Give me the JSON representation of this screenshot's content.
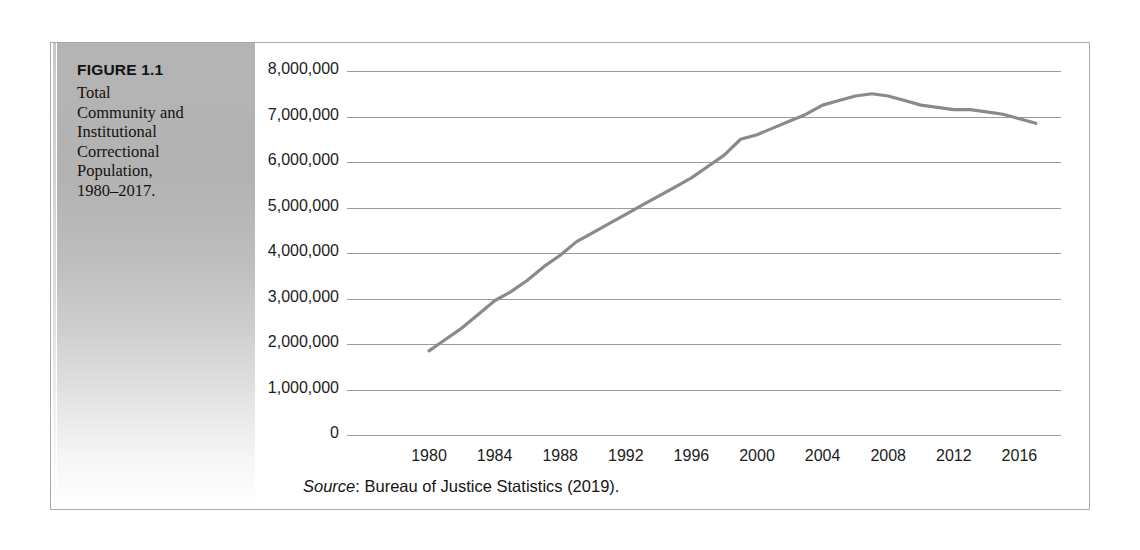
{
  "figure": {
    "label": "FIGURE 1.1",
    "caption": "Total Community and Institutional Correctional Population, 1980–2017.",
    "source_word": "Source",
    "source_separator": ": ",
    "source_text": "Bureau of Justice Statistics (2019)."
  },
  "colors": {
    "frame_border": "#a9a9a9",
    "gridline": "#9b9b9b",
    "series_line": "#8a8a8a",
    "panel_top": "#b4b4b4",
    "panel_bottom": "#ffffff",
    "text": "#1c1c1c"
  },
  "chart_data": {
    "type": "line",
    "title": "Total Community and Institutional Correctional Population, 1980–2017.",
    "xlabel": "",
    "ylabel": "",
    "xlim": [
      1980,
      2017
    ],
    "ylim": [
      0,
      8000000
    ],
    "grid": true,
    "legend": "none",
    "y_tick_labels": [
      "8,000,000",
      "7,000,000",
      "6,000,000",
      "5,000,000",
      "4,000,000",
      "3,000,000",
      "2,000,000",
      "1,000,000",
      "0"
    ],
    "y_ticks": [
      8000000,
      7000000,
      6000000,
      5000000,
      4000000,
      3000000,
      2000000,
      1000000,
      0
    ],
    "x_tick_labels": [
      "1980",
      "1984",
      "1988",
      "1992",
      "1996",
      "2000",
      "2004",
      "2008",
      "2012",
      "2016"
    ],
    "x_ticks": [
      1980,
      1984,
      1988,
      1992,
      1996,
      2000,
      2004,
      2008,
      2012,
      2016
    ],
    "series": [
      {
        "name": "Total correctional population",
        "x": [
          1980,
          1981,
          1982,
          1983,
          1984,
          1985,
          1986,
          1987,
          1988,
          1989,
          1990,
          1991,
          1992,
          1993,
          1994,
          1995,
          1996,
          1997,
          1998,
          1999,
          2000,
          2001,
          2002,
          2003,
          2004,
          2005,
          2006,
          2007,
          2008,
          2009,
          2010,
          2011,
          2012,
          2013,
          2014,
          2015,
          2016,
          2017
        ],
        "values": [
          1850000,
          2100000,
          2350000,
          2650000,
          2950000,
          3150000,
          3400000,
          3700000,
          3950000,
          4250000,
          4450000,
          4650000,
          4850000,
          5050000,
          5250000,
          5450000,
          5650000,
          5900000,
          6150000,
          6500000,
          6600000,
          6750000,
          6900000,
          7050000,
          7250000,
          7350000,
          7450000,
          7500000,
          7450000,
          7350000,
          7250000,
          7200000,
          7150000,
          7150000,
          7100000,
          7050000,
          6950000,
          6850000
        ]
      }
    ],
    "source": "Bureau of Justice Statistics (2019)."
  }
}
